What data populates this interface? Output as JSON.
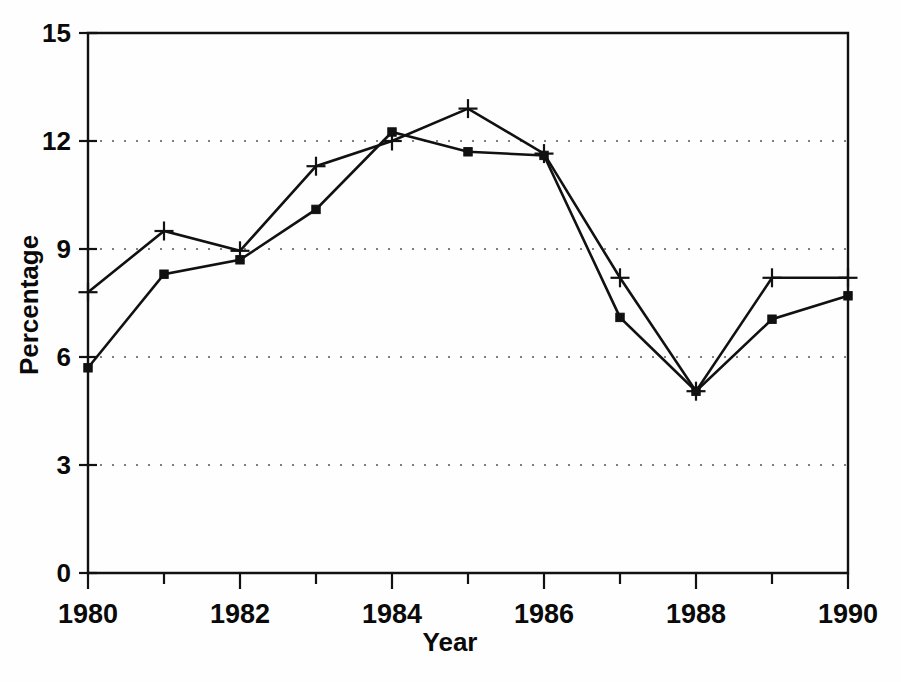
{
  "chart_data": {
    "type": "line",
    "title": "",
    "subtitle": "",
    "xlabel": "Year",
    "ylabel": "Percentage",
    "x": [
      1980,
      1981,
      1982,
      1983,
      1984,
      1985,
      1986,
      1987,
      1988,
      1989,
      1990
    ],
    "xlim": [
      1980,
      1990
    ],
    "ylim": [
      0,
      15
    ],
    "xticks": [
      1980,
      1982,
      1984,
      1986,
      1988,
      1990
    ],
    "xtick_labels": [
      "1980",
      "1982",
      "1984",
      "1986",
      "1988",
      "1990"
    ],
    "xminor_ticks": [
      1981,
      1983,
      1985,
      1987,
      1989
    ],
    "yticks": [
      0,
      3,
      6,
      9,
      12,
      15
    ],
    "ytick_labels": [
      "0",
      "3",
      "6",
      "9",
      "12",
      "15"
    ],
    "grid": true,
    "grid_axis": "y",
    "grid_style": "dotted",
    "legend": "none",
    "series": [
      {
        "name": "series-plus",
        "marker": "plus",
        "values": [
          7.8,
          9.5,
          8.95,
          11.3,
          12.0,
          12.9,
          11.65,
          8.2,
          5.05,
          8.2,
          8.2
        ]
      },
      {
        "name": "series-square",
        "marker": "square",
        "values": [
          5.7,
          8.3,
          8.7,
          10.1,
          12.25,
          11.7,
          11.6,
          7.1,
          5.05,
          7.05,
          7.7
        ]
      }
    ],
    "colors": {
      "line": "#111111",
      "grid": "#3a3a3a",
      "axis": "#111111",
      "background": "#ffffff"
    }
  },
  "caption": {
    "partial_text": ""
  }
}
